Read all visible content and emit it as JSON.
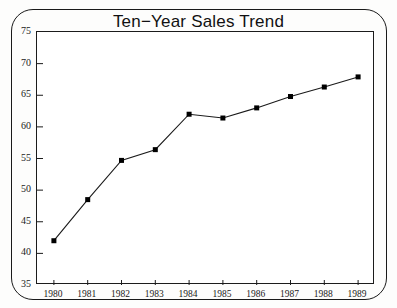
{
  "chart_data": {
    "type": "line",
    "title": "Ten−Year Sales Trend",
    "xlabel": "",
    "ylabel": "",
    "categories": [
      "1980",
      "1981",
      "1982",
      "1983",
      "1984",
      "1985",
      "1986",
      "1987",
      "1988",
      "1989"
    ],
    "x": [
      1980,
      1981,
      1982,
      1983,
      1984,
      1985,
      1986,
      1987,
      1988,
      1989
    ],
    "values": [
      42,
      48.5,
      54.7,
      56.4,
      62,
      61.4,
      63,
      64.8,
      66.3,
      67.9
    ],
    "series": [
      {
        "name": "Sales",
        "values": [
          42,
          48.5,
          54.7,
          56.4,
          62,
          61.4,
          63,
          64.8,
          66.3,
          67.9
        ]
      }
    ],
    "ylim": [
      35,
      75
    ],
    "yticks": [
      35,
      40,
      45,
      50,
      55,
      60,
      65,
      70,
      75
    ],
    "ytick_labels": [
      "35",
      "40",
      "45",
      "50",
      "55",
      "60",
      "65",
      "70",
      "75"
    ],
    "xtick_labels": [
      "1980",
      "1981",
      "1982",
      "1983",
      "1984",
      "1985",
      "1986",
      "1987",
      "1988",
      "1989"
    ],
    "grid": false,
    "legend": "none",
    "marker": "filled-square",
    "line_color": "#1a1a1a",
    "marker_color": "#000000",
    "background_color": "#ffffff"
  }
}
